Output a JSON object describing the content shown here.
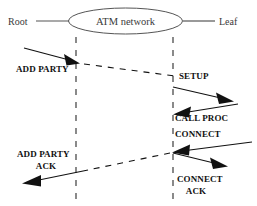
{
  "diagram": {
    "type": "sequence-diagram",
    "colors": {
      "background": "#ffffff",
      "node_stroke": "#555555",
      "lifeline": "#2b2b2b",
      "message": "#111111",
      "label_text": "#111111",
      "node_text": "#3a3a3a"
    },
    "nodes": {
      "root_label": "Root",
      "network_label": "ATM network",
      "leaf_label": "Leaf"
    },
    "messages": [
      {
        "id": "add-party",
        "label": "ADD PARTY",
        "direction": "root-to-network"
      },
      {
        "id": "setup",
        "label": "SETUP",
        "direction": "network-to-leaf"
      },
      {
        "id": "call-proc",
        "label": "CALL PROC",
        "direction": "leaf-to-network"
      },
      {
        "id": "connect",
        "label": "CONNECT",
        "direction": "leaf-to-network"
      },
      {
        "id": "connect-ack",
        "label": "CONNECT\nACK",
        "direction": "network-to-leaf"
      },
      {
        "id": "add-party-ack",
        "label": "ADD PARTY\nACK",
        "direction": "network-to-root"
      }
    ],
    "labels": {
      "root": "Root",
      "network": "ATM network",
      "leaf": "Leaf",
      "add_party": "ADD PARTY",
      "setup": "SETUP",
      "call_proc": "CALL PROC",
      "connect": "CONNECT",
      "connect_ack_line1": "CONNECT",
      "connect_ack_line2": "ACK",
      "add_party_ack_line1": "ADD PARTY",
      "add_party_ack_line2": "ACK"
    }
  }
}
